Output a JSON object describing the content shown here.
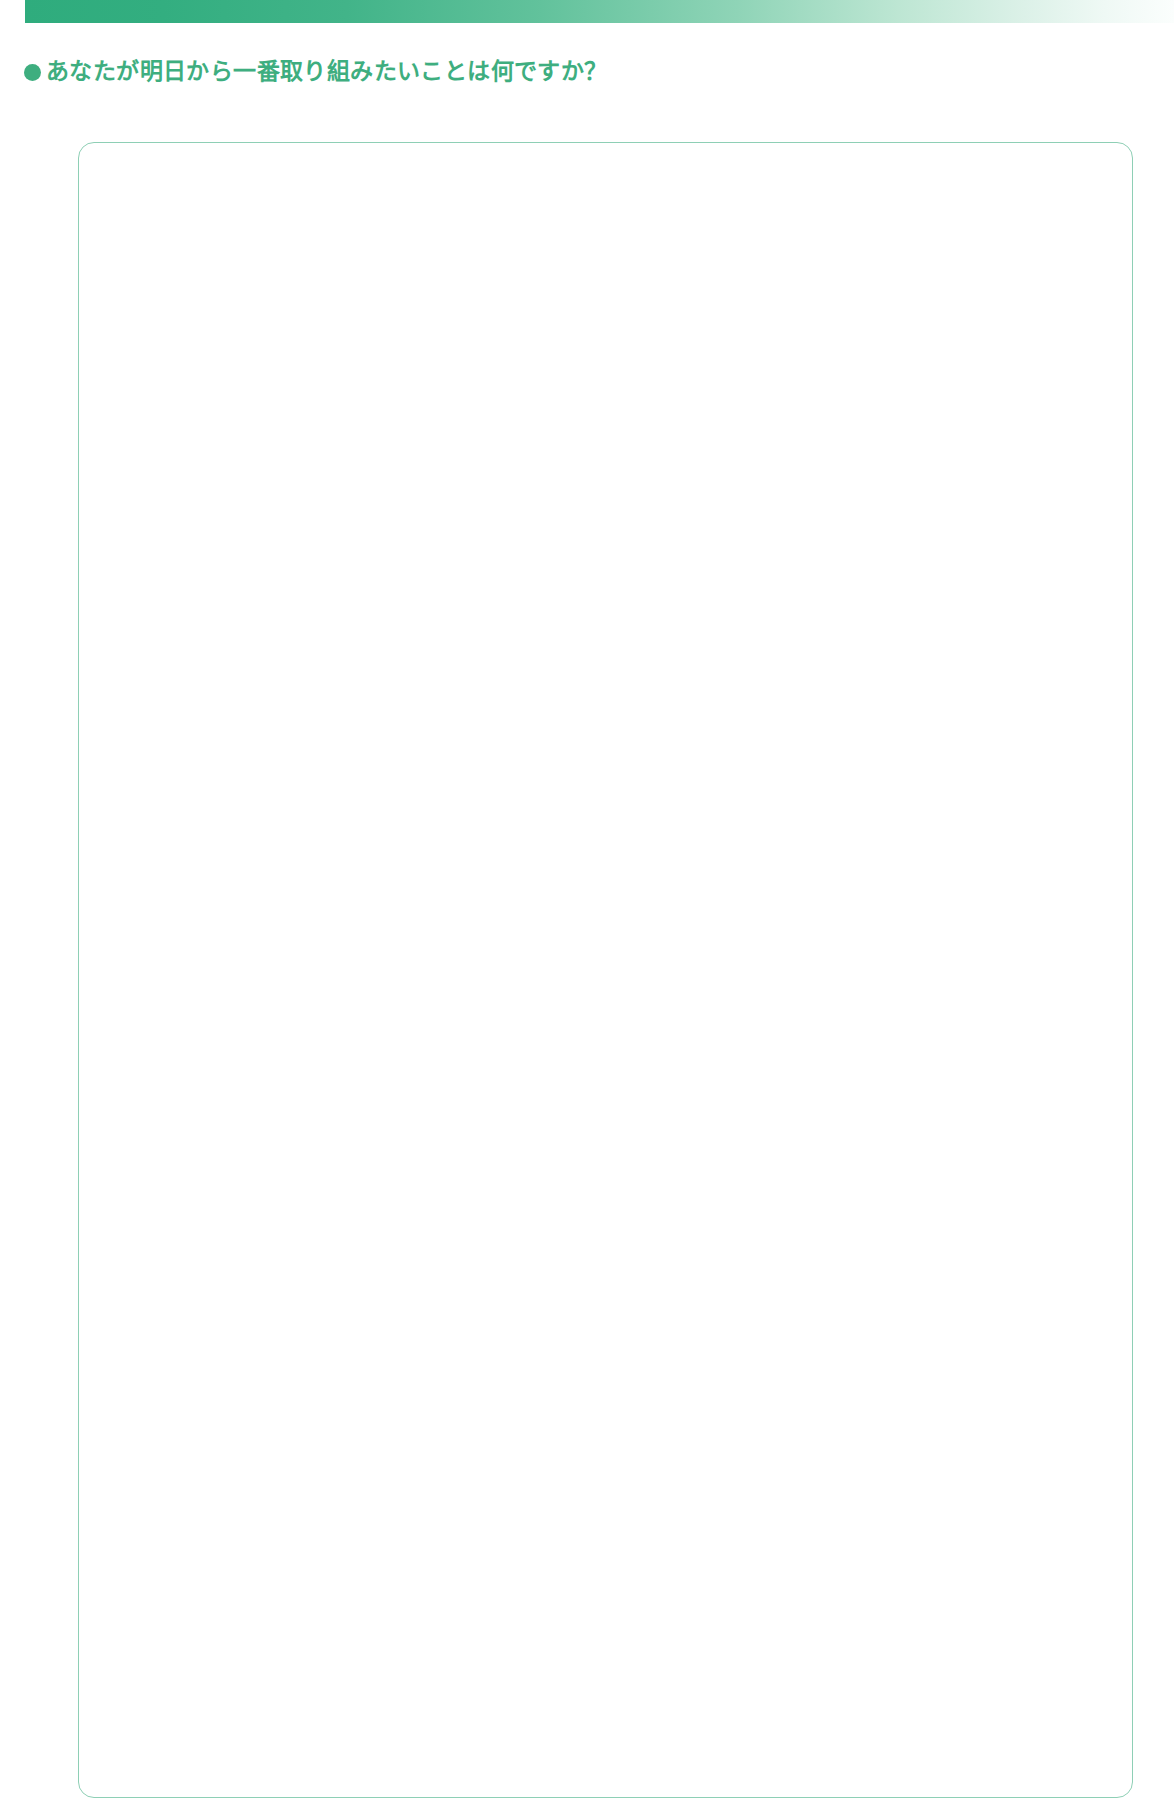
{
  "page": {
    "background_color": "#ffffff",
    "width": 1174,
    "height": 1816
  },
  "header": {
    "decor_bar": {
      "name": "top-gradient-bar",
      "start_color": "#2FAC7D",
      "end_color": "#FBFEFD"
    }
  },
  "question": {
    "bullet": "●",
    "text": "あなたが明日から一番取り組みたいことは何ですか？",
    "color": "#3EAE7F"
  },
  "answer": {
    "value": "",
    "placeholder": "",
    "border_color": "#8ECFB5"
  }
}
